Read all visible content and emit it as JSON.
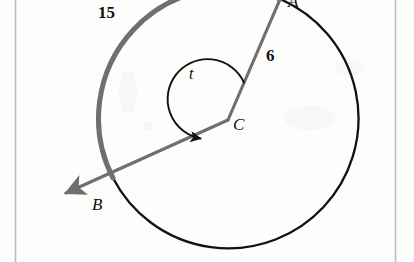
{
  "figure": {
    "type": "circle-sector-diagram",
    "background_color": "#fdfdfc",
    "page_border_color": "#b9b9b9",
    "circle": {
      "center_label": "C",
      "center_px": [
        228,
        120
      ],
      "radius_px": 130,
      "stroke_color": "#111111",
      "minor_arc_color": "#111111",
      "major_arc_color": "#6f6f6f",
      "major_arc_width_px": 5
    },
    "points": [
      {
        "name": "A",
        "label": "A",
        "px": [
          280,
          -1
        ],
        "note": "endpoint of radius labeled 6, top of figure, label clipped by image edge"
      },
      {
        "name": "B",
        "label": "B",
        "px": [
          113,
          178
        ],
        "note": "endpoint of ray through C, lower left"
      },
      {
        "name": "C",
        "label": "C",
        "px": [
          228,
          120
        ],
        "note": "center of circle"
      }
    ],
    "segments": [
      {
        "from": "C",
        "to": "A",
        "label": "6",
        "label_px": [
          271,
          56
        ],
        "color": "#6f6f6f",
        "width_px": 3
      },
      {
        "from": "C",
        "to": "B",
        "label": "",
        "color": "#6f6f6f",
        "width_px": 3,
        "arrow": true,
        "arrow_tip_px": [
          62,
          196
        ]
      }
    ],
    "arcs": [
      {
        "name": "major-arc-AB",
        "label": "15",
        "label_px": [
          104,
          14
        ],
        "color": "#6f6f6f",
        "description": "thick gray arc from A counterclockwise to B"
      },
      {
        "name": "minor-arc-AB",
        "label": "",
        "color": "#111111",
        "description": "thin black arc from A clockwise around to B"
      },
      {
        "name": "angle-arc-t",
        "label": "t",
        "label_px": [
          192,
          74
        ],
        "color": "#111111",
        "description": "central angle arc from ray CA counterclockwise to ray CB with arrowhead"
      }
    ],
    "labels": {
      "arc_length": "15",
      "radius": "6",
      "angle": "t",
      "point_a": "A",
      "point_b": "B",
      "point_c": "C"
    }
  }
}
